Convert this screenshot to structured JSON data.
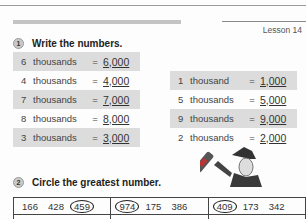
{
  "header": {
    "lesson": "Lesson 14"
  },
  "section1": {
    "number": "1",
    "title": "Write the numbers.",
    "left": [
      {
        "n": "6",
        "word": "thousands",
        "eq": "=",
        "answer": "6,000",
        "shaded": true
      },
      {
        "n": "4",
        "word": "thousands",
        "eq": "=",
        "answer": "4,000",
        "shaded": false
      },
      {
        "n": "7",
        "word": "thousands",
        "eq": "=",
        "answer": "7,000",
        "shaded": true
      },
      {
        "n": "8",
        "word": "thousands",
        "eq": "=",
        "answer": "8,000",
        "shaded": false
      },
      {
        "n": "3",
        "word": "thousands",
        "eq": "=",
        "answer": "3,000",
        "shaded": true
      }
    ],
    "right": [
      {
        "n": "1",
        "word": "thousand",
        "eq": "=",
        "answer": "1,000",
        "shaded": true
      },
      {
        "n": "5",
        "word": "thousands",
        "eq": "=",
        "answer": "5,000",
        "shaded": false
      },
      {
        "n": "9",
        "word": "thousands",
        "eq": "=",
        "answer": "9,000",
        "shaded": true
      },
      {
        "n": "2",
        "word": "thousands",
        "eq": "=",
        "answer": "2,000",
        "shaded": false
      }
    ]
  },
  "section2": {
    "number": "2",
    "title": "Circle the greatest number.",
    "illustration": "wizard-with-wand",
    "rows": [
      [
        {
          "values": [
            "166",
            "428",
            "459"
          ],
          "circled": 2
        },
        {
          "values": [
            "974",
            "175",
            "386"
          ],
          "circled": 0
        },
        {
          "values": [
            "409",
            "173",
            "342"
          ],
          "circled": 0
        }
      ]
    ]
  }
}
